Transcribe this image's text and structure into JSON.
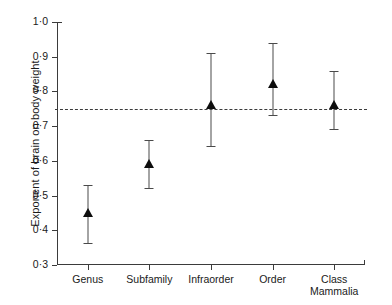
{
  "chart_data": {
    "type": "scatter",
    "title": "",
    "xlabel": "",
    "ylabel": "Exponent of brain on body weight",
    "ylim": [
      0.3,
      1.0
    ],
    "ytick_labels": [
      "1·0",
      "0·9",
      "0·8",
      "0·7",
      "0·6",
      "0·5",
      "0·4",
      "0·3"
    ],
    "ytick_values": [
      1.0,
      0.9,
      0.8,
      0.7,
      0.6,
      0.5,
      0.4,
      0.3
    ],
    "grid": false,
    "legend": "none",
    "categories": [
      "Genus",
      "Subfamily",
      "Infraorder",
      "Order",
      "Class\nMammalia"
    ],
    "points": [
      {
        "category": "Genus",
        "value": 0.45,
        "low": 0.36,
        "high": 0.53
      },
      {
        "category": "Subfamily",
        "value": 0.59,
        "low": 0.52,
        "high": 0.66
      },
      {
        "category": "Infraorder",
        "value": 0.76,
        "low": 0.64,
        "high": 0.91
      },
      {
        "category": "Order",
        "value": 0.82,
        "low": 0.73,
        "high": 0.94
      },
      {
        "category": "Class Mammalia",
        "value": 0.76,
        "low": 0.69,
        "high": 0.86
      }
    ],
    "reference_line": {
      "value": 0.75,
      "style": "dashed"
    },
    "marker_style": "filled-triangle",
    "colors": {
      "axis": "#3b3b3b",
      "marker": "#0d0d0d",
      "errorbar": "#4a4a4a",
      "background": "#ffffff"
    }
  }
}
